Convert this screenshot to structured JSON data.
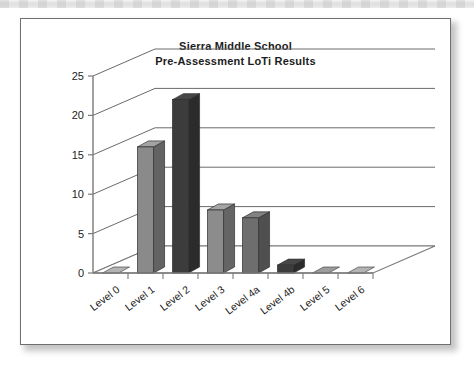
{
  "page": {
    "background": "#ffffff",
    "scan_band": true
  },
  "card": {
    "border_color": "#6f6f6f",
    "background": "#ffffff"
  },
  "chart_data": {
    "type": "bar",
    "title": "Sierra Middle School",
    "subtitle": "Pre-Assessment LoTi Results",
    "xlabel": "",
    "ylabel": "",
    "categories": [
      "Level 0",
      "Level 1",
      "Level 2",
      "Level 3",
      "Level 4a",
      "Level 4b",
      "Level 5",
      "Level 6"
    ],
    "values": [
      0,
      16,
      22,
      8,
      7,
      1,
      0,
      0
    ],
    "bar_colors": [
      "#b4b4b4",
      "#8a8a8a",
      "#3c3c3c",
      "#8c8c8c",
      "#6e6e6e",
      "#3c3c3c",
      "#9d9d9d",
      "#b4b4b4"
    ],
    "ylim": [
      0,
      25
    ],
    "yticks": [
      0,
      5,
      10,
      15,
      20,
      25
    ],
    "ytick_labels": [
      "0",
      "5",
      "10",
      "15",
      "20",
      "25"
    ],
    "grid": true,
    "legend": false,
    "style": "3d-column",
    "gridline_color": "#6a6a6a",
    "axis_color": "#7a7a7a"
  }
}
